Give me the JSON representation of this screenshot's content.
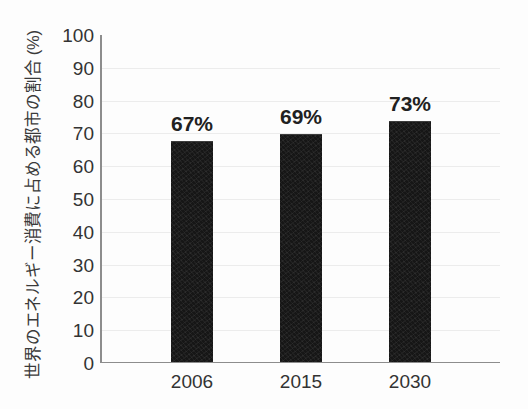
{
  "chart_data": {
    "type": "bar",
    "title": "",
    "xlabel": "",
    "ylabel": "世界のエネルギー消費に占める都市の割合 (%)",
    "categories": [
      "2006",
      "2015",
      "2030"
    ],
    "values": [
      67,
      69,
      73
    ],
    "data_labels": [
      "67%",
      "69%",
      "73%"
    ],
    "ylim": [
      0,
      100
    ],
    "ytick_labels": [
      "100",
      "90",
      "80",
      "70",
      "60",
      "50",
      "40",
      "30",
      "20",
      "10",
      "0"
    ],
    "ytick_values": [
      100,
      90,
      80,
      70,
      60,
      50,
      40,
      30,
      20,
      10,
      0
    ],
    "grid": true,
    "legend": false,
    "series": [
      {
        "name": "",
        "values": [
          67,
          69,
          73
        ],
        "color": "#161616"
      }
    ]
  },
  "style": {
    "bar_color": "#161616",
    "axis_color": "#8d8d8d",
    "grid_color": "#ececec",
    "text_color": "#333333",
    "background": "#fdfdfd"
  }
}
